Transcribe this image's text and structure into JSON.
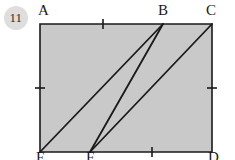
{
  "figure": {
    "problem_number": "11",
    "colors": {
      "fill": "#c9c9c9",
      "stroke": "#1a1a1a",
      "badge_background": "#dedede",
      "page_background": "#ffffff"
    },
    "shape": {
      "type": "rectangle",
      "corners": {
        "A": {
          "x": 40,
          "y": 24
        },
        "C": {
          "x": 212,
          "y": 24
        },
        "D": {
          "x": 212,
          "y": 152
        },
        "E": {
          "x": 40,
          "y": 152
        }
      },
      "points_on_edges": {
        "B": {
          "x": 163,
          "y": 24,
          "edge": "top"
        },
        "F": {
          "x": 90,
          "y": 152,
          "edge": "bottom"
        }
      },
      "segments": [
        {
          "name": "E-to-B",
          "from": "E",
          "to": "B",
          "x1": 40,
          "y1": 152,
          "x2": 163,
          "y2": 24
        },
        {
          "name": "F-to-B",
          "from": "F",
          "to": "B",
          "x1": 90,
          "y1": 152,
          "x2": 163,
          "y2": 24
        },
        {
          "name": "F-to-C",
          "from": "F",
          "to": "C",
          "x1": 90,
          "y1": 152,
          "x2": 212,
          "y2": 24
        }
      ],
      "tick_marks": [
        {
          "name": "tick-top",
          "edge": "top",
          "x": 103,
          "y": 24,
          "orientation": "vertical"
        },
        {
          "name": "tick-bottom",
          "edge": "bottom",
          "x": 152,
          "y": 152,
          "orientation": "vertical"
        },
        {
          "name": "tick-left",
          "edge": "left",
          "x": 40,
          "y": 88,
          "orientation": "horizontal"
        },
        {
          "name": "tick-right",
          "edge": "right",
          "x": 212,
          "y": 88,
          "orientation": "horizontal"
        }
      ]
    },
    "labels": {
      "A": "A",
      "B": "B",
      "C": "C",
      "D": "D",
      "E": "E",
      "F": "F"
    }
  }
}
